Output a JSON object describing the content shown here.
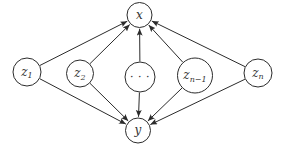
{
  "diagram": {
    "type": "directed-graph",
    "style": {
      "background": "#ffffff",
      "stroke_color": "#2b2b2b",
      "text_color": "#333333",
      "stroke_width": 1
    },
    "nodes": [
      {
        "id": "x",
        "label": "x",
        "sub": "",
        "x": 139.5,
        "y": 15,
        "r": 12.5,
        "italic": true
      },
      {
        "id": "y",
        "label": "y",
        "sub": "",
        "x": 138,
        "y": 130.5,
        "r": 12.5,
        "italic": true
      },
      {
        "id": "z1",
        "label": "z",
        "sub": "1",
        "x": 27,
        "y": 72,
        "r": 14,
        "italic": true
      },
      {
        "id": "z2",
        "label": "z",
        "sub": "2",
        "x": 80,
        "y": 73.5,
        "r": 13.5,
        "italic": true
      },
      {
        "id": "dots",
        "label": "· · ·",
        "sub": "",
        "x": 140,
        "y": 77,
        "r": 15,
        "italic": false
      },
      {
        "id": "zn1",
        "label": "z",
        "sub": "n−1",
        "x": 195,
        "y": 75.5,
        "r": 17.5,
        "italic": true
      },
      {
        "id": "zn",
        "label": "z",
        "sub": "n",
        "x": 258,
        "y": 73,
        "r": 14,
        "italic": true
      }
    ],
    "edges": [
      {
        "from": "z1",
        "to": "x"
      },
      {
        "from": "z2",
        "to": "x"
      },
      {
        "from": "dots",
        "to": "x"
      },
      {
        "from": "zn1",
        "to": "x"
      },
      {
        "from": "zn",
        "to": "x"
      },
      {
        "from": "z1",
        "to": "y"
      },
      {
        "from": "z2",
        "to": "y"
      },
      {
        "from": "dots",
        "to": "y"
      },
      {
        "from": "zn1",
        "to": "y"
      },
      {
        "from": "zn",
        "to": "y"
      }
    ]
  }
}
